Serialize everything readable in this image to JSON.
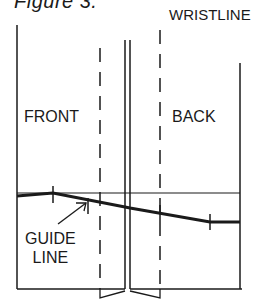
{
  "figure": {
    "title": "Figure 3.",
    "labels": {
      "wristline": "WRISTLINE",
      "front": "FRONT",
      "back": "BACK",
      "guide_line_1": "GUIDE",
      "guide_line_2": "LINE"
    },
    "colors": {
      "ink": "#1a1a1a",
      "background": "#ffffff"
    }
  }
}
